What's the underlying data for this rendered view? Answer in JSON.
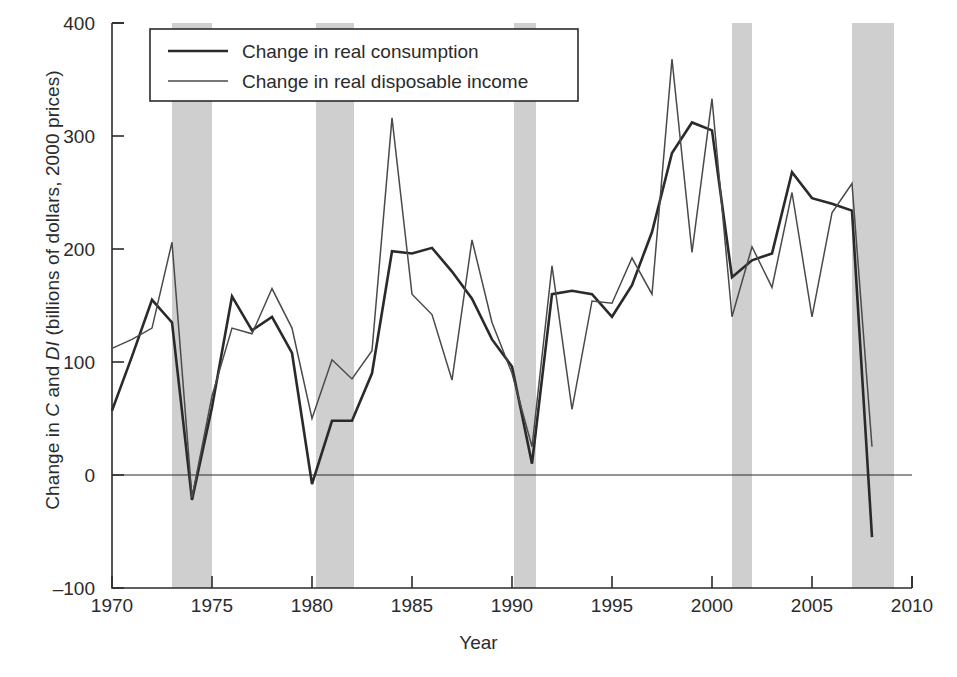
{
  "chart_data": {
    "type": "line",
    "title": "",
    "xlabel": "Year",
    "ylabel": "Change in C and DI (billions of dollars, 2000 prices)",
    "ylabel_parts": {
      "pre": "Change in ",
      "italic1": "C",
      "mid": " and ",
      "italic2": "DI",
      "post": " (billions of dollars, 2000 prices)"
    },
    "xlim": [
      1970,
      2010
    ],
    "ylim": [
      -100,
      400
    ],
    "xticks": [
      1970,
      1975,
      1980,
      1985,
      1990,
      1995,
      2000,
      2005,
      2010
    ],
    "yticks": [
      -100,
      0,
      100,
      200,
      300,
      400
    ],
    "xtick_labels": [
      "1970",
      "1975",
      "1980",
      "1985",
      "1990",
      "1995",
      "2000",
      "2005",
      "2010"
    ],
    "ytick_labels": [
      "-100",
      "0",
      "100",
      "200",
      "300",
      "400"
    ],
    "grid": false,
    "legend_position": "top-left-inside",
    "zero_line": true,
    "x": [
      1970,
      1971,
      1972,
      1973,
      1974,
      1975,
      1976,
      1977,
      1978,
      1979,
      1980,
      1981,
      1982,
      1983,
      1984,
      1985,
      1986,
      1987,
      1988,
      1989,
      1990,
      1991,
      1992,
      1993,
      1994,
      1995,
      1996,
      1997,
      1998,
      1999,
      2000,
      2001,
      2002,
      2003,
      2004,
      2005,
      2006,
      2007,
      2008
    ],
    "series": [
      {
        "name": "Change in real consumption",
        "color": "#2a2a2a",
        "linewidth": 2.6,
        "values": [
          57,
          105,
          155,
          135,
          -22,
          60,
          158,
          128,
          140,
          108,
          -8,
          48,
          48,
          90,
          198,
          196,
          201,
          180,
          156,
          120,
          96,
          10,
          160,
          163,
          160,
          140,
          168,
          215,
          285,
          312,
          305,
          175,
          190,
          196,
          268,
          245,
          240,
          234,
          -55
        ]
      },
      {
        "name": "Change in real disposable income",
        "color": "#4a4a4a",
        "linewidth": 1.5,
        "values": [
          112,
          120,
          130,
          206,
          -20,
          70,
          130,
          125,
          165,
          130,
          50,
          102,
          85,
          110,
          316,
          160,
          142,
          84,
          208,
          135,
          90,
          25,
          185,
          58,
          154,
          152,
          192,
          160,
          368,
          197,
          333,
          140,
          202,
          166,
          250,
          140,
          232,
          258,
          25
        ]
      }
    ],
    "recession_bands": [
      {
        "start": 1973.0,
        "end": 1975.0
      },
      {
        "start": 1980.2,
        "end": 1982.1
      },
      {
        "start": 1990.1,
        "end": 1991.2
      },
      {
        "start": 2001.0,
        "end": 2002.0
      },
      {
        "start": 2007.0,
        "end": 2009.1
      }
    ],
    "band_color": "#cfcfcf"
  },
  "legend": {
    "items": [
      {
        "label": "Change in real consumption"
      },
      {
        "label": "Change in real disposable income"
      }
    ]
  }
}
